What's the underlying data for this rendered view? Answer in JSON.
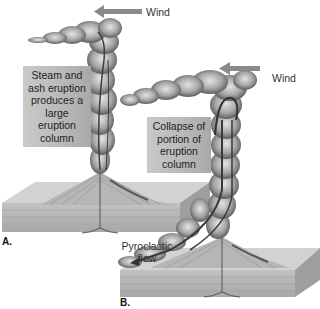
{
  "panels": {
    "a": {
      "letter": "A.",
      "wind_label": "Wind",
      "caption": "Steam and ash eruption produces a large eruption column",
      "caption_lines": [
        "Steam and",
        "ash eruption",
        "produces a",
        "large eruption",
        "column"
      ]
    },
    "b": {
      "letter": "B.",
      "wind_label": "Wind",
      "caption": "Collapse of portion of eruption column",
      "caption_lines": [
        "Collapse of",
        "portion of",
        "eruption",
        "column"
      ],
      "flow_label": "Pyroclastic flow",
      "flow_label_lines": [
        "Pyroclastic",
        "flow"
      ]
    }
  },
  "colors": {
    "arrow": "#8a8a8a",
    "cloud": "#8f8f8f",
    "ground_top": "#cfcfcf",
    "ground_side": "#b3b3b3",
    "label_bg": "#bdbdbd"
  }
}
